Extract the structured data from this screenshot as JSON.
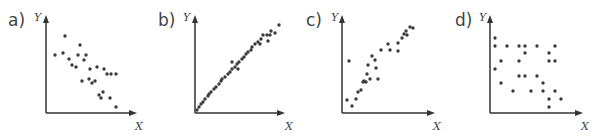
{
  "chart_data": [
    {
      "type": "scatter",
      "label": "a)",
      "xlabel": "X",
      "ylabel": "Y",
      "description": "moderate negative correlation",
      "origin": [
        46,
        113
      ],
      "axis_end": {
        "x": 137,
        "y": 15
      },
      "points": [
        [
          65,
          36
        ],
        [
          55,
          55
        ],
        [
          63,
          53
        ],
        [
          80,
          45
        ],
        [
          78,
          55
        ],
        [
          86,
          55
        ],
        [
          69,
          59
        ],
        [
          84,
          60
        ],
        [
          72,
          65
        ],
        [
          76,
          67
        ],
        [
          90,
          69
        ],
        [
          97,
          67
        ],
        [
          104,
          69
        ],
        [
          107,
          74
        ],
        [
          111,
          74
        ],
        [
          116,
          74
        ],
        [
          82,
          81
        ],
        [
          89,
          79
        ],
        [
          92,
          83
        ],
        [
          95,
          81
        ],
        [
          103,
          92
        ],
        [
          99,
          95
        ],
        [
          101,
          98
        ],
        [
          110,
          98
        ],
        [
          116,
          107
        ]
      ]
    },
    {
      "type": "scatter",
      "label": "b)",
      "xlabel": "X",
      "ylabel": "Y",
      "description": "strong positive correlation",
      "origin": [
        195,
        113
      ],
      "axis_end": {
        "x": 285,
        "y": 15
      },
      "points": [
        [
          197,
          110
        ],
        [
          199,
          107
        ],
        [
          201,
          104
        ],
        [
          203,
          102
        ],
        [
          205,
          99
        ],
        [
          208,
          96
        ],
        [
          209,
          94
        ],
        [
          211,
          92
        ],
        [
          214,
          89
        ],
        [
          216,
          87
        ],
        [
          219,
          84
        ],
        [
          221,
          81
        ],
        [
          222,
          79
        ],
        [
          225,
          77
        ],
        [
          228,
          74
        ],
        [
          230,
          72
        ],
        [
          232,
          69
        ],
        [
          235,
          67
        ],
        [
          237,
          64
        ],
        [
          239,
          62
        ],
        [
          232,
          62
        ],
        [
          238,
          69
        ],
        [
          242,
          59
        ],
        [
          244,
          57
        ],
        [
          246,
          54
        ],
        [
          248,
          52
        ],
        [
          251,
          50
        ],
        [
          252,
          47
        ],
        [
          255,
          44
        ],
        [
          258,
          42
        ],
        [
          261,
          39
        ],
        [
          263,
          35
        ],
        [
          267,
          35
        ],
        [
          270,
          35
        ],
        [
          271,
          31
        ],
        [
          275,
          33
        ],
        [
          279,
          25
        ],
        [
          260,
          44
        ],
        [
          268,
          41
        ]
      ]
    },
    {
      "type": "scatter",
      "label": "c)",
      "xlabel": "X",
      "ylabel": "Y",
      "description": "moderate positive correlation with outlier",
      "origin": [
        342,
        113
      ],
      "axis_end": {
        "x": 435,
        "y": 15
      },
      "points": [
        [
          349,
          61
        ],
        [
          347,
          100
        ],
        [
          352,
          106
        ],
        [
          356,
          99
        ],
        [
          358,
          92
        ],
        [
          361,
          90
        ],
        [
          363,
          82
        ],
        [
          366,
          82
        ],
        [
          364,
          81
        ],
        [
          368,
          65
        ],
        [
          367,
          74
        ],
        [
          370,
          79
        ],
        [
          372,
          56
        ],
        [
          375,
          60
        ],
        [
          376,
          68
        ],
        [
          378,
          79
        ],
        [
          381,
          50
        ],
        [
          388,
          44
        ],
        [
          390,
          50
        ],
        [
          398,
          51
        ],
        [
          398,
          43
        ],
        [
          402,
          38
        ],
        [
          404,
          34
        ],
        [
          406,
          31
        ],
        [
          407,
          35
        ],
        [
          410,
          27
        ],
        [
          413,
          28
        ]
      ]
    },
    {
      "type": "scatter",
      "label": "d)",
      "xlabel": "X",
      "ylabel": "Y",
      "description": "no clear correlation / weak",
      "origin": [
        490,
        113
      ],
      "axis_end": {
        "x": 583,
        "y": 15
      },
      "points": [
        [
          495,
          38
        ],
        [
          495,
          46
        ],
        [
          507,
          46
        ],
        [
          519,
          46
        ],
        [
          525,
          46
        ],
        [
          537,
          46
        ],
        [
          555,
          46
        ],
        [
          525,
          53
        ],
        [
          549,
          53
        ],
        [
          501,
          61
        ],
        [
          519,
          61
        ],
        [
          549,
          61
        ],
        [
          555,
          61
        ],
        [
          495,
          69
        ],
        [
          519,
          76
        ],
        [
          525,
          76
        ],
        [
          537,
          76
        ],
        [
          501,
          83
        ],
        [
          543,
          83
        ],
        [
          513,
          91
        ],
        [
          531,
          91
        ],
        [
          543,
          91
        ],
        [
          555,
          91
        ],
        [
          549,
          99
        ],
        [
          561,
          99
        ],
        [
          549,
          107
        ]
      ]
    }
  ]
}
